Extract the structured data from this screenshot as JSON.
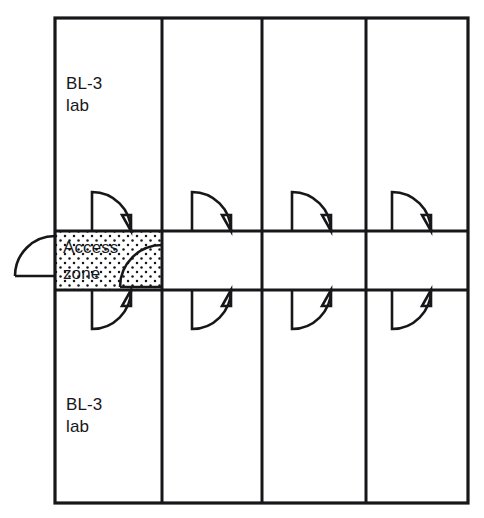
{
  "diagram": {
    "type": "architectural-floor-plan",
    "colors": {
      "wall": "#17171a",
      "background": "#ffffff",
      "stipple": "#17171a",
      "text": "#17171a"
    },
    "outline": {
      "x": 55,
      "y": 18,
      "width": 413,
      "height": 485,
      "stroke_width": 3
    },
    "corridor": {
      "label": "",
      "x": 55,
      "y": 231,
      "width": 413,
      "height": 59
    },
    "partitions_x": [
      162,
      262,
      366
    ],
    "labels": [
      {
        "id": "upper-lab",
        "line1": "BL-3",
        "line2": "lab",
        "x": 66,
        "y": 89
      },
      {
        "id": "access-zone",
        "line1": "Access",
        "line2": "zone",
        "x": 63,
        "y": 253
      },
      {
        "id": "lower-lab",
        "line1": "BL-3",
        "line2": "lab",
        "x": 66,
        "y": 410
      }
    ],
    "access_zone": {
      "x": 55,
      "y": 231,
      "width": 108,
      "height": 59,
      "fill": "stipple"
    },
    "doors": [
      {
        "id": "door-upper-lab-1",
        "column": 1,
        "side": "upper",
        "hinge_x": 92,
        "swing": "up-right"
      },
      {
        "id": "door-upper-lab-2",
        "column": 2,
        "side": "upper",
        "hinge_x": 192,
        "swing": "up-right"
      },
      {
        "id": "door-upper-lab-3",
        "column": 3,
        "side": "upper",
        "hinge_x": 292,
        "swing": "up-right"
      },
      {
        "id": "door-upper-lab-4",
        "column": 4,
        "side": "upper",
        "hinge_x": 392,
        "swing": "up-right"
      },
      {
        "id": "door-lower-lab-1",
        "column": 1,
        "side": "lower",
        "hinge_x": 92,
        "swing": "down-right"
      },
      {
        "id": "door-lower-lab-2",
        "column": 2,
        "side": "lower",
        "hinge_x": 192,
        "swing": "down-right"
      },
      {
        "id": "door-lower-lab-3",
        "column": 3,
        "side": "lower",
        "hinge_x": 292,
        "swing": "down-right"
      },
      {
        "id": "door-lower-lab-4",
        "column": 4,
        "side": "lower",
        "hinge_x": 392,
        "swing": "down-right"
      },
      {
        "id": "door-exterior-entry",
        "side": "left-exterior",
        "hinge_x": 55,
        "swing": "left"
      },
      {
        "id": "door-access-zone-corridor",
        "side": "corridor",
        "hinge_x": 162,
        "swing": "left"
      }
    ]
  }
}
